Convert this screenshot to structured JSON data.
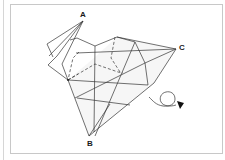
{
  "diagram": {
    "type": "origami-fold-step",
    "labels": {
      "a": "A",
      "b": "B",
      "c": "C"
    },
    "symbols": {
      "turn_over": "turn-over-arrow-icon"
    },
    "colors": {
      "line": "#333333",
      "frame": "#c8c8c8",
      "fill": "#f7f7f7",
      "arrowhead": "#111111"
    }
  }
}
